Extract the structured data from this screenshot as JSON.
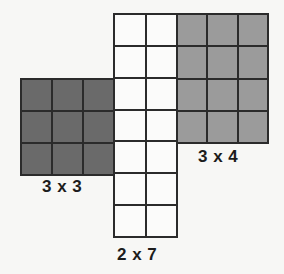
{
  "figure": {
    "name": "net-of-rectangular-grids",
    "background_color": "#f7f7f5",
    "line_color": "#2b2b2b"
  },
  "blocks": [
    {
      "id": "grid-left",
      "name": "grid-3x3-dark",
      "label": "3 x 3",
      "rows": 3,
      "columns": 3,
      "cell_count": 9,
      "fill_color": "#6a6a6a",
      "shade": "dark-gray"
    },
    {
      "id": "grid-strip",
      "name": "grid-2x7-white",
      "label": "2 x 7",
      "rows": 7,
      "columns": 2,
      "cell_count": 14,
      "fill_color": "#fbfbfa",
      "shade": "white"
    },
    {
      "id": "grid-right",
      "name": "grid-3x4-gray",
      "label": "3 x 4",
      "rows": 4,
      "columns": 3,
      "cell_count": 12,
      "fill_color": "#9b9b9b",
      "shade": "medium-gray"
    }
  ],
  "labels": {
    "left": "3 x 3",
    "right": "3 x 4",
    "strip": "2 x 7"
  },
  "chart_data": {
    "type": "table",
    "title": "",
    "xlabel": "",
    "ylabel": "",
    "categories": [
      "3 x 3",
      "2 x 7",
      "3 x 4"
    ],
    "values": [
      9,
      14,
      12
    ],
    "series": [
      {
        "name": "rows",
        "values": [
          3,
          7,
          4
        ]
      },
      {
        "name": "columns",
        "values": [
          3,
          2,
          3
        ]
      },
      {
        "name": "area",
        "values": [
          9,
          14,
          12
        ]
      }
    ],
    "grid": true,
    "legend": "none",
    "annotations": [
      "3 x 3",
      "2 x 7",
      "3 x 4"
    ]
  }
}
